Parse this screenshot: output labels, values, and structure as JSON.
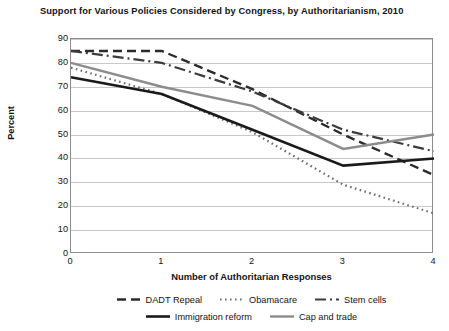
{
  "chart_data": {
    "type": "line",
    "title": "Support for Various Policies Considered by Congress, by Authoritarianism, 2010",
    "xlabel": "Number of Authoritarian Responses",
    "ylabel": "Percent",
    "x": [
      0,
      1,
      2,
      3,
      4
    ],
    "xticklabels": [
      "0",
      "1",
      "2",
      "3",
      "4"
    ],
    "yticklabels": [
      "0",
      "10",
      "20",
      "30",
      "40",
      "50",
      "60",
      "70",
      "80",
      "90"
    ],
    "yticks": [
      0,
      10,
      20,
      30,
      40,
      50,
      60,
      70,
      80,
      90
    ],
    "xlim": [
      0,
      4
    ],
    "ylim": [
      0,
      90
    ],
    "grid": "horizontal",
    "legend_position": "bottom",
    "series": [
      {
        "name": "DADT Repeal",
        "values": [
          85,
          85,
          69,
          50,
          33
        ],
        "color": "#2b2b2b",
        "dash": "9,5",
        "width": 2.4
      },
      {
        "name": "Obamacare",
        "values": [
          78,
          67,
          51,
          29,
          17
        ],
        "color": "#6e6e6e",
        "dash": "1.6,3.4",
        "width": 2.2
      },
      {
        "name": "Stem cells",
        "values": [
          85,
          80,
          68,
          52,
          43
        ],
        "color": "#3c3c3c",
        "dash": "11,4,2,4",
        "width": 2.2
      },
      {
        "name": "Immigration reform",
        "values": [
          74,
          67,
          52,
          37,
          40
        ],
        "color": "#1a1a1a",
        "dash": "none",
        "width": 2.6
      },
      {
        "name": "Cap and trade",
        "values": [
          80,
          70,
          62,
          44,
          50
        ],
        "color": "#8c8c8c",
        "dash": "none",
        "width": 2.4
      }
    ]
  }
}
